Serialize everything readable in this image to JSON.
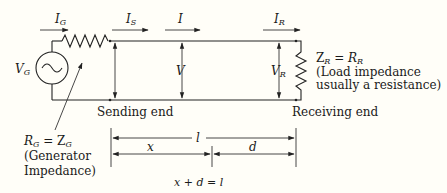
{
  "diagram": {
    "currents": {
      "generator": {
        "main": "I",
        "sub": "G"
      },
      "sending": {
        "main": "I",
        "sub": "S"
      },
      "line": {
        "main": "I",
        "sub": ""
      },
      "receiving": {
        "main": "I",
        "sub": "R"
      }
    },
    "voltages": {
      "generator": {
        "main": "V",
        "sub": "G"
      },
      "line": {
        "main": "V",
        "sub": ""
      },
      "receiving": {
        "main": "V",
        "sub": "R"
      }
    },
    "load": {
      "equation_left": "Z",
      "equation_left_sub": "R",
      "equation_eq": " = ",
      "equation_right": "R",
      "equation_right_sub": "R",
      "note_line1": "(Load impedance",
      "note_line2": "usually a resistance)"
    },
    "generator_impedance": {
      "equation_left": "R",
      "equation_left_sub": "G",
      "equation_eq": " = Z",
      "equation_right_sub": "G",
      "note_line1": "(Generator",
      "note_line2": "Impedance)"
    },
    "ends": {
      "sending": "Sending end",
      "receiving": "Receiving end"
    },
    "dimensions": {
      "total": "l",
      "from_sending": "x",
      "from_receiving": "d",
      "relation": "x + d = l"
    }
  }
}
